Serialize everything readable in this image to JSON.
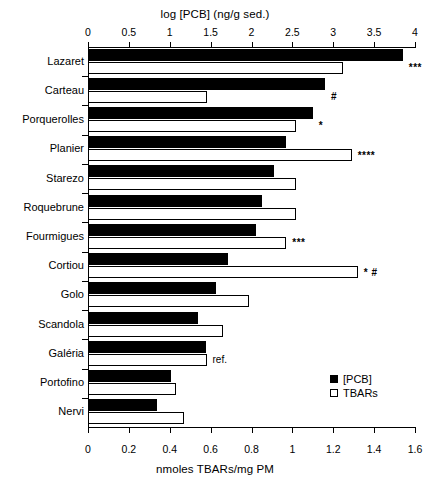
{
  "chart_data": {
    "type": "bar",
    "orientation": "horizontal",
    "title": "",
    "top_axis": {
      "label": "log [PCB] (ng/g sed.)",
      "ticks": [
        0,
        0.5,
        1,
        1.5,
        2,
        2.5,
        3,
        3.5,
        4
      ],
      "tick_labels": [
        "0",
        "0.5",
        "1",
        "1.5",
        "2",
        "2.5",
        "3",
        "3.5",
        "4"
      ],
      "lim": [
        0,
        4
      ]
    },
    "bottom_axis": {
      "label": "nmoles TBARs/mg PM",
      "ticks": [
        0,
        0.2,
        0.4,
        0.6,
        0.8,
        1,
        1.2,
        1.4,
        1.6
      ],
      "tick_labels": [
        "0",
        "0.2",
        "0.4",
        "0.6",
        "0.8",
        "1",
        "1.2",
        "1.4",
        "1.6"
      ],
      "lim": [
        0,
        1.6
      ]
    },
    "categories": [
      "Lazaret",
      "Carteau",
      "Porquerolles",
      "Planier",
      "Starezo",
      "Roquebrune",
      "Fourmigues",
      "Cortiou",
      "Golo",
      "Scandola",
      "Galéria",
      "Portofino",
      "Nervi"
    ],
    "series": [
      {
        "name": "[PCB]",
        "axis": "top",
        "style": "filled",
        "values": [
          3.85,
          2.9,
          2.75,
          2.42,
          2.28,
          2.13,
          2.05,
          1.71,
          1.56,
          1.34,
          1.44,
          1.02,
          0.84
        ]
      },
      {
        "name": "TBARs",
        "axis": "bottom",
        "style": "hollow",
        "values": [
          1.25,
          0.58,
          1.02,
          1.29,
          1.02,
          1.02,
          0.97,
          1.32,
          0.79,
          0.66,
          0.58,
          0.43,
          0.47
        ]
      }
    ],
    "annotations": [
      {
        "category": "Lazaret",
        "text": "***"
      },
      {
        "category": "Carteau",
        "text": "#"
      },
      {
        "category": "Porquerolles",
        "text": "*"
      },
      {
        "category": "Planier",
        "text": "****"
      },
      {
        "category": "Fourmigues",
        "text": "***"
      },
      {
        "category": "Cortiou",
        "text": "* #"
      },
      {
        "category": "Galéria",
        "text": "ref."
      }
    ],
    "legend": {
      "position": "bottom-right",
      "entries": [
        {
          "label": "[PCB]",
          "style": "filled"
        },
        {
          "label": "TBARs",
          "style": "hollow"
        }
      ]
    },
    "grid": false
  }
}
